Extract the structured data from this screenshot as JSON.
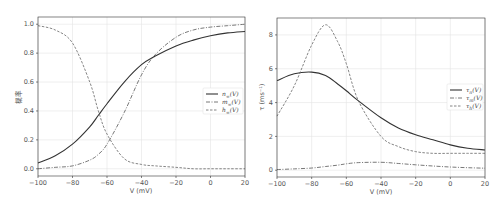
{
  "chart_data": [
    {
      "type": "line",
      "title": "",
      "xlabel": "V (mV)",
      "ylabel": "概率",
      "xlim": [
        -100,
        20
      ],
      "ylim": [
        -0.05,
        1.05
      ],
      "xticks": [
        "−100",
        "−80",
        "−60",
        "−40",
        "−20",
        "0",
        "20"
      ],
      "xtick_values": [
        -100,
        -80,
        -60,
        -40,
        -20,
        0,
        20
      ],
      "yticks": [
        "0.0",
        "0.2",
        "0.4",
        "0.6",
        "0.8",
        "1.0"
      ],
      "ytick_values": [
        0,
        0.2,
        0.4,
        0.6,
        0.8,
        1.0
      ],
      "grid": true,
      "legend_position": "center right",
      "x": [
        -100,
        -90,
        -80,
        -70,
        -65,
        -60,
        -50,
        -40,
        -32,
        -20,
        -10,
        0,
        10,
        20
      ],
      "series": [
        {
          "name": "n∞(V)",
          "style": "solid",
          "values": [
            0.04,
            0.09,
            0.17,
            0.29,
            0.37,
            0.45,
            0.6,
            0.72,
            0.78,
            0.85,
            0.89,
            0.92,
            0.94,
            0.95
          ]
        },
        {
          "name": "m∞(V)",
          "style": "dashdot",
          "values": [
            0.0,
            0.01,
            0.02,
            0.06,
            0.1,
            0.17,
            0.39,
            0.65,
            0.79,
            0.91,
            0.96,
            0.98,
            0.99,
            1.0
          ]
        },
        {
          "name": "h∞(V)",
          "style": "dashed",
          "values": [
            0.99,
            0.96,
            0.87,
            0.6,
            0.4,
            0.24,
            0.07,
            0.03,
            0.02,
            0.01,
            0.0,
            0.0,
            0.0,
            0.0
          ]
        }
      ]
    },
    {
      "type": "line",
      "title": "",
      "xlabel": "V (mV)",
      "ylabel": "τ (ms⁻¹)",
      "xlim": [
        -100,
        20
      ],
      "ylim": [
        -0.4,
        9.0
      ],
      "xticks": [
        "−100",
        "−80",
        "−60",
        "−40",
        "−20",
        "0",
        "20"
      ],
      "xtick_values": [
        -100,
        -80,
        -60,
        -40,
        -20,
        0,
        20
      ],
      "yticks": [
        "0",
        "2",
        "4",
        "6",
        "8"
      ],
      "ytick_values": [
        0,
        2,
        4,
        6,
        8
      ],
      "grid": true,
      "legend_position": "center right",
      "x": [
        -100,
        -90,
        -80,
        -72,
        -65,
        -60,
        -53,
        -40,
        -30,
        -20,
        -10,
        0,
        10,
        20
      ],
      "series": [
        {
          "name": "τn(V)",
          "style": "solid",
          "values": [
            5.3,
            5.7,
            5.8,
            5.6,
            5.1,
            4.7,
            4.1,
            3.1,
            2.5,
            2.1,
            1.8,
            1.5,
            1.3,
            1.2
          ]
        },
        {
          "name": "τm(V)",
          "style": "dashdot",
          "values": [
            0.04,
            0.08,
            0.13,
            0.22,
            0.3,
            0.38,
            0.45,
            0.47,
            0.4,
            0.32,
            0.25,
            0.19,
            0.15,
            0.12
          ]
        },
        {
          "name": "τh(V)",
          "style": "dashed",
          "values": [
            3.2,
            5.0,
            7.4,
            8.6,
            7.6,
            6.3,
            4.1,
            2.0,
            1.4,
            1.1,
            1.0,
            1.0,
            1.0,
            1.0
          ]
        }
      ]
    }
  ],
  "legends": {
    "left": [
      {
        "label": "n∞(V)",
        "base": "n",
        "sub": "∞"
      },
      {
        "label": "m∞(V)",
        "base": "m",
        "sub": "∞"
      },
      {
        "label": "h∞(V)",
        "base": "h",
        "sub": "∞"
      }
    ],
    "right": [
      {
        "label": "τn(V)",
        "base": "τ",
        "sub": "n"
      },
      {
        "label": "τm(V)",
        "base": "τ",
        "sub": "m"
      },
      {
        "label": "τh(V)",
        "base": "τ",
        "sub": "h"
      }
    ]
  },
  "colors": {
    "n": "#333333",
    "m": "#555555",
    "h": "#666666"
  }
}
